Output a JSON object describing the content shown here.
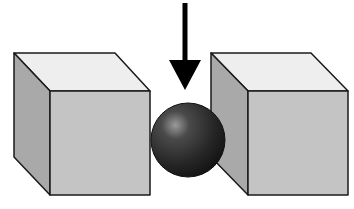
{
  "diagram": {
    "colors": {
      "background": "#ffffff",
      "outline": "#1a1a1a",
      "cube_top": "#eeeeee",
      "cube_front": "#c4c4c4",
      "cube_side": "#a9a9a9",
      "sphere_dark": "#1e1e1e",
      "sphere_mid": "#4a4a4a",
      "sphere_highlight": "#9a9a9a",
      "arrow": "#000000"
    },
    "elements": [
      {
        "id": "left-cube",
        "type": "cube"
      },
      {
        "id": "sphere",
        "type": "sphere"
      },
      {
        "id": "right-cube",
        "type": "cube"
      },
      {
        "id": "down-arrow",
        "type": "arrow",
        "direction": "down"
      }
    ]
  }
}
